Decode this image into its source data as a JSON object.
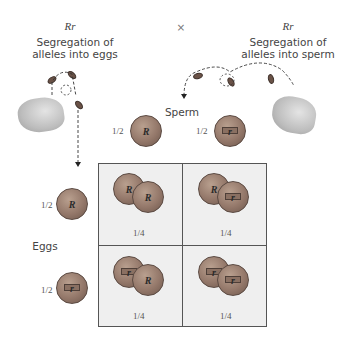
{
  "parents": {
    "left": {
      "genotype": "Rr",
      "caption_line1": "Segregation of",
      "caption_line2": "alleles into eggs"
    },
    "cross_symbol": "×",
    "right": {
      "genotype": "Rr",
      "caption_line1": "Segregation of",
      "caption_line2": "alleles into sperm"
    }
  },
  "axes": {
    "sperm_label": "Sperm",
    "eggs_label": "Eggs"
  },
  "sperm": [
    {
      "fraction": "1/2",
      "allele": "R",
      "coin_face": "heads"
    },
    {
      "fraction": "1/2",
      "allele": "r",
      "coin_face": "tails"
    }
  ],
  "eggs": [
    {
      "fraction": "1/2",
      "allele": "R",
      "coin_face": "heads"
    },
    {
      "fraction": "1/2",
      "allele": "r",
      "coin_face": "tails"
    }
  ],
  "punnett": {
    "cells": [
      {
        "row": 0,
        "col": 0,
        "alleles": [
          "R",
          "R"
        ],
        "probability": "1/4"
      },
      {
        "row": 0,
        "col": 1,
        "alleles": [
          "R",
          "r"
        ],
        "probability": "1/4"
      },
      {
        "row": 1,
        "col": 0,
        "alleles": [
          "r",
          "R"
        ],
        "probability": "1/4"
      },
      {
        "row": 1,
        "col": 1,
        "alleles": [
          "r",
          "r"
        ],
        "probability": "1/4"
      }
    ]
  },
  "colors": {
    "grid_bg": "#efefef",
    "grid_line": "#555555",
    "coin": "#94786a"
  }
}
